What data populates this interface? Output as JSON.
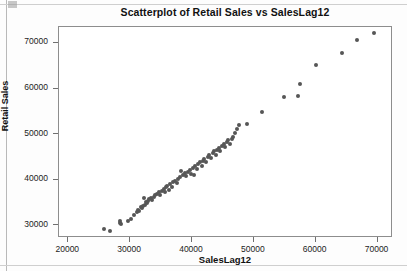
{
  "chart_data": {
    "type": "scatter",
    "title": "Scatterplot of Retail Sales vs SalesLag12",
    "xlabel": "SalesLag12",
    "ylabel": "Retail Sales",
    "xlim": [
      18500,
      72500
    ],
    "ylim": [
      27200,
      73500
    ],
    "xticks": [
      20000,
      30000,
      40000,
      50000,
      60000,
      70000
    ],
    "yticks": [
      30000,
      40000,
      50000,
      60000,
      70000
    ],
    "xtick_labels": [
      "20000",
      "30000",
      "40000",
      "50000",
      "60000",
      "70000"
    ],
    "ytick_labels": [
      "30000",
      "40000",
      "50000",
      "60000",
      "70000"
    ],
    "grid": false,
    "legend": false,
    "marker": "circle",
    "marker_color": "#565656",
    "frame_color": "#8d8d8d",
    "series": [
      {
        "name": "Retail Sales vs SalesLag12",
        "points": [
          [
            25800,
            29100
          ],
          [
            26700,
            28800
          ],
          [
            28300,
            30600
          ],
          [
            28400,
            31000
          ],
          [
            28600,
            30200
          ],
          [
            29700,
            30900
          ],
          [
            30100,
            31400
          ],
          [
            30700,
            32300
          ],
          [
            31100,
            32800
          ],
          [
            31300,
            33400
          ],
          [
            31500,
            33100
          ],
          [
            31700,
            34000
          ],
          [
            31900,
            33700
          ],
          [
            32100,
            34300
          ],
          [
            32200,
            35900
          ],
          [
            32400,
            34500
          ],
          [
            32500,
            35100
          ],
          [
            32700,
            34800
          ],
          [
            32900,
            35400
          ],
          [
            33100,
            35700
          ],
          [
            33400,
            36000
          ],
          [
            33600,
            35500
          ],
          [
            33800,
            36300
          ],
          [
            34000,
            36600
          ],
          [
            34300,
            36900
          ],
          [
            34600,
            37200
          ],
          [
            34900,
            36700
          ],
          [
            35100,
            37600
          ],
          [
            35400,
            38000
          ],
          [
            35600,
            37400
          ],
          [
            35800,
            38300
          ],
          [
            36000,
            38700
          ],
          [
            36300,
            37800
          ],
          [
            36500,
            39100
          ],
          [
            36800,
            38500
          ],
          [
            37000,
            39400
          ],
          [
            37300,
            39800
          ],
          [
            37600,
            39200
          ],
          [
            37800,
            40200
          ],
          [
            38000,
            40600
          ],
          [
            38300,
            41900
          ],
          [
            38500,
            41000
          ],
          [
            38800,
            41400
          ],
          [
            39000,
            40800
          ],
          [
            39300,
            41700
          ],
          [
            39600,
            42200
          ],
          [
            39800,
            41300
          ],
          [
            40100,
            42600
          ],
          [
            40300,
            41100
          ],
          [
            40500,
            43000
          ],
          [
            40800,
            42400
          ],
          [
            41000,
            43400
          ],
          [
            41300,
            43800
          ],
          [
            41600,
            43100
          ],
          [
            41800,
            44200
          ],
          [
            42000,
            44600
          ],
          [
            42300,
            43900
          ],
          [
            42600,
            45000
          ],
          [
            42800,
            45400
          ],
          [
            43100,
            44700
          ],
          [
            43400,
            45800
          ],
          [
            43600,
            46200
          ],
          [
            43900,
            45500
          ],
          [
            44100,
            46600
          ],
          [
            44400,
            47000
          ],
          [
            44600,
            46300
          ],
          [
            44900,
            47400
          ],
          [
            45100,
            47800
          ],
          [
            45400,
            47100
          ],
          [
            45600,
            48200
          ],
          [
            45900,
            48600
          ],
          [
            46200,
            47900
          ],
          [
            46400,
            49000
          ],
          [
            46700,
            49400
          ],
          [
            47000,
            50200
          ],
          [
            47300,
            51100
          ],
          [
            47600,
            51900
          ],
          [
            48900,
            52300
          ],
          [
            51300,
            54800
          ],
          [
            54900,
            58100
          ],
          [
            57200,
            58400
          ],
          [
            57400,
            61100
          ],
          [
            60100,
            65200
          ],
          [
            64200,
            67800
          ],
          [
            66700,
            70700
          ],
          [
            69500,
            72200
          ]
        ]
      }
    ]
  }
}
